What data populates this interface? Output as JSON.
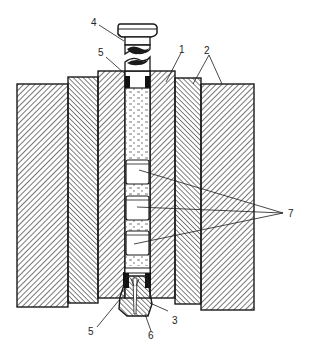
{
  "diagram": {
    "type": "cross-section",
    "colors": {
      "line": "#1a1a1a",
      "background": "#ffffff",
      "fill_dots": "#555555"
    },
    "labels": [
      {
        "id": "1",
        "text": "1",
        "target": "inner-die-sleeve"
      },
      {
        "id": "2",
        "text": "2",
        "target": "outer-die-rings"
      },
      {
        "id": "3",
        "text": "3",
        "target": "bottom-plug"
      },
      {
        "id": "4",
        "text": "4",
        "target": "top-punch"
      },
      {
        "id": "5a",
        "text": "5",
        "target": "upper-seal"
      },
      {
        "id": "5b",
        "text": "5",
        "target": "lower-seal"
      },
      {
        "id": "6",
        "text": "6",
        "target": "plug-channel"
      },
      {
        "id": "7",
        "text": "7",
        "target": "sample-capsules"
      }
    ]
  }
}
